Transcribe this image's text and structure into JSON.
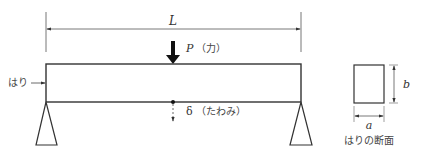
{
  "diagram": {
    "type": "simply-supported beam with center point load",
    "labels": {
      "span": "L",
      "force": "P（力）",
      "force_symbol": "P",
      "force_text": "（力）",
      "deflection_symbol": "δ",
      "deflection_text": "（たわみ）",
      "beam": "はり",
      "width": "a",
      "height": "b",
      "section_caption": "はりの断面"
    },
    "colors": {
      "line": "#333333",
      "force_arrow": "#111111",
      "background": "#ffffff"
    }
  }
}
